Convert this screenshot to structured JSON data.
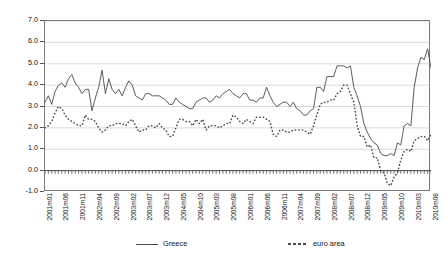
{
  "chart_data": {
    "type": "line",
    "title": "",
    "xlabel": "",
    "ylabel": "",
    "ylim": [
      -1.0,
      7.0
    ],
    "y_ticks": [
      -1.0,
      0.0,
      1.0,
      2.0,
      3.0,
      4.0,
      5.0,
      6.0,
      7.0
    ],
    "y_tick_labels": [
      "-1.0",
      "0.0",
      "1.0",
      "2.0",
      "3.0",
      "4.0",
      "5.0",
      "6.0",
      "7.0"
    ],
    "grid": true,
    "legend_position": "bottom",
    "x_all": [
      "2001m01",
      "2001m02",
      "2001m03",
      "2001m04",
      "2001m05",
      "2001m06",
      "2001m07",
      "2001m08",
      "2001m09",
      "2001m10",
      "2001m11",
      "2001m12",
      "2002m01",
      "2002m02",
      "2002m03",
      "2002m04",
      "2002m05",
      "2002m06",
      "2002m07",
      "2002m08",
      "2002m09",
      "2002m10",
      "2002m11",
      "2002m12",
      "2003m01",
      "2003m02",
      "2003m03",
      "2003m04",
      "2003m05",
      "2003m06",
      "2003m07",
      "2003m08",
      "2003m09",
      "2003m10",
      "2003m11",
      "2003m12",
      "2004m01",
      "2004m02",
      "2004m03",
      "2004m04",
      "2004m05",
      "2004m06",
      "2004m07",
      "2004m08",
      "2004m09",
      "2004m10",
      "2004m11",
      "2004m12",
      "2005m01",
      "2005m02",
      "2005m03",
      "2005m04",
      "2005m05",
      "2005m06",
      "2005m07",
      "2005m08",
      "2005m09",
      "2005m10",
      "2005m11",
      "2005m12",
      "2006m01",
      "2006m02",
      "2006m03",
      "2006m04",
      "2006m05",
      "2006m06",
      "2006m07",
      "2006m08",
      "2006m09",
      "2006m10",
      "2006m11",
      "2006m12",
      "2007m01",
      "2007m02",
      "2007m03",
      "2007m04",
      "2007m05",
      "2007m06",
      "2007m07",
      "2007m08",
      "2007m09",
      "2007m10",
      "2007m11",
      "2007m12",
      "2008m01",
      "2008m02",
      "2008m03",
      "2008m04",
      "2008m05",
      "2008m06",
      "2008m07",
      "2008m08",
      "2008m09",
      "2008m10",
      "2008m11",
      "2008m12",
      "2009m01",
      "2009m02",
      "2009m03",
      "2009m04",
      "2009m05",
      "2009m06",
      "2009m07",
      "2009m08",
      "2009m09",
      "2009m10",
      "2009m11",
      "2009m12",
      "2010m01",
      "2010m02",
      "2010m03",
      "2010m04",
      "2010m05",
      "2010m06",
      "2010m07",
      "2010m08"
    ],
    "x_tick_labels": [
      "2001m01",
      "2001m06",
      "2001m11",
      "2002m04",
      "2002m09",
      "2003m02",
      "2003m07",
      "2003m12",
      "2004m05",
      "2004m10",
      "2005m03",
      "2005m08",
      "2006m01",
      "2006m06",
      "2006m11",
      "2007m04",
      "2007m09",
      "2008m02",
      "2008m07",
      "2008m12",
      "2009m05",
      "2009m10",
      "2010m03",
      "2010m08"
    ],
    "x_tick_indices": [
      0,
      5,
      10,
      15,
      20,
      25,
      30,
      35,
      40,
      45,
      50,
      55,
      60,
      65,
      70,
      75,
      80,
      85,
      90,
      95,
      100,
      105,
      110,
      115
    ],
    "series": [
      {
        "name": "Greece",
        "style": "solid",
        "color": "#4a4a4a",
        "values": [
          3.2,
          3.5,
          3.1,
          3.7,
          4.0,
          4.1,
          3.9,
          4.3,
          4.5,
          4.1,
          3.9,
          3.6,
          3.8,
          3.8,
          2.8,
          3.4,
          3.9,
          4.7,
          3.6,
          4.3,
          3.8,
          3.6,
          3.8,
          3.5,
          3.9,
          4.2,
          4.0,
          3.5,
          3.4,
          3.3,
          3.6,
          3.6,
          3.5,
          3.5,
          3.5,
          3.4,
          3.3,
          3.1,
          3.1,
          3.4,
          3.2,
          3.1,
          3.0,
          2.9,
          2.9,
          3.2,
          3.3,
          3.4,
          3.4,
          3.2,
          3.3,
          3.5,
          3.4,
          3.6,
          3.7,
          3.8,
          3.6,
          3.5,
          3.4,
          3.6,
          3.6,
          3.3,
          3.3,
          3.2,
          3.4,
          3.4,
          3.9,
          3.5,
          3.2,
          3.0,
          3.1,
          3.2,
          3.2,
          3.0,
          3.2,
          2.9,
          2.8,
          2.6,
          2.6,
          2.8,
          2.9,
          3.9,
          3.9,
          3.7,
          4.4,
          4.4,
          4.4,
          4.9,
          4.9,
          4.9,
          4.8,
          4.9,
          3.9,
          3.5,
          3.0,
          2.2,
          1.8,
          1.5,
          1.3,
          1.2,
          0.8,
          0.7,
          0.7,
          0.8,
          0.7,
          1.3,
          1.2,
          2.1,
          2.2,
          2.1,
          3.9,
          4.8,
          5.3,
          5.2,
          5.7,
          4.8
        ]
      },
      {
        "name": "euro area",
        "style": "dotted",
        "color": "#4a4a4a",
        "values": [
          2.0,
          2.1,
          2.3,
          2.7,
          3.0,
          2.9,
          2.6,
          2.4,
          2.3,
          2.2,
          2.1,
          2.1,
          2.6,
          2.4,
          2.4,
          2.3,
          2.0,
          1.8,
          1.9,
          2.1,
          2.1,
          2.2,
          2.2,
          2.2,
          2.1,
          2.3,
          2.4,
          2.1,
          1.8,
          1.9,
          1.9,
          2.1,
          2.1,
          2.0,
          2.2,
          2.0,
          1.9,
          1.6,
          1.6,
          2.0,
          2.4,
          2.4,
          2.3,
          2.3,
          2.1,
          2.4,
          2.2,
          2.4,
          1.9,
          2.1,
          2.1,
          2.1,
          2.0,
          2.1,
          2.2,
          2.2,
          2.6,
          2.5,
          2.3,
          2.2,
          2.4,
          2.3,
          2.2,
          2.5,
          2.5,
          2.5,
          2.4,
          2.3,
          1.7,
          1.6,
          1.9,
          1.9,
          1.8,
          1.8,
          1.9,
          1.9,
          1.9,
          1.9,
          1.8,
          1.7,
          2.1,
          2.6,
          3.1,
          3.2,
          3.2,
          3.3,
          3.3,
          3.6,
          3.7,
          4.0,
          4.0,
          3.6,
          3.2,
          2.1,
          1.6,
          1.6,
          1.1,
          1.2,
          0.6,
          0.6,
          0.0,
          -0.1,
          -0.6,
          -0.7,
          -0.3,
          -0.1,
          0.5,
          0.9,
          1.0,
          0.9,
          1.4,
          1.5,
          1.6,
          1.6,
          1.4,
          1.7,
          1.7,
          1.9
        ]
      }
    ]
  }
}
